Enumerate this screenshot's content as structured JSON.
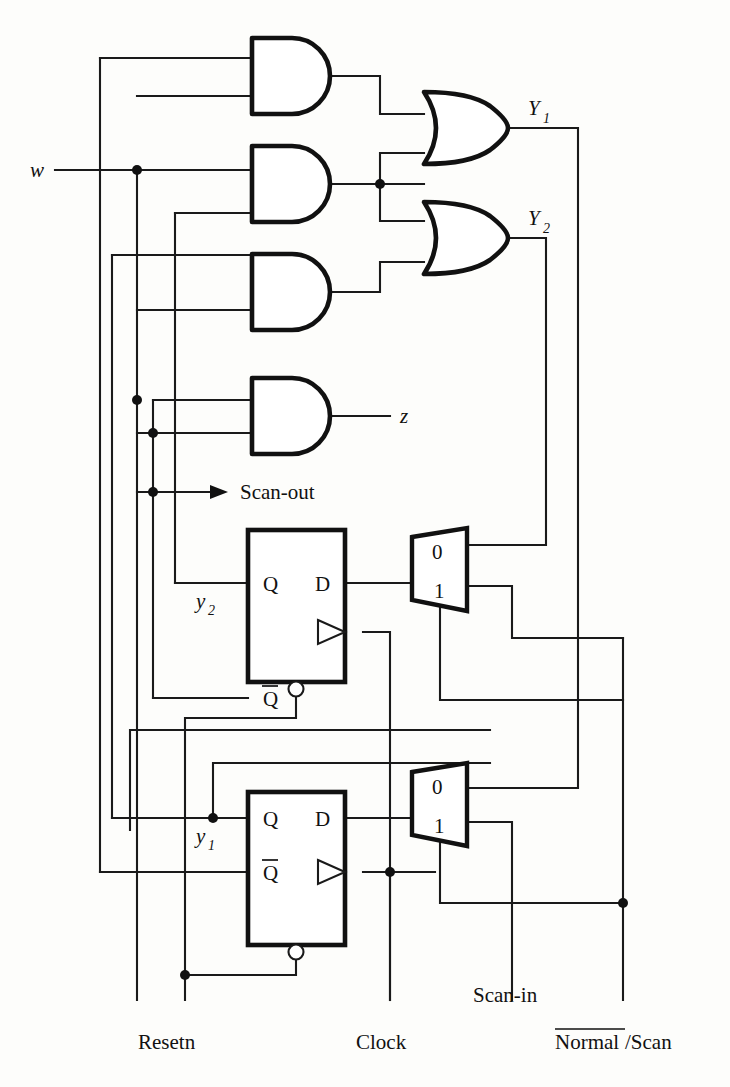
{
  "figure": {
    "type": "logic-circuit-schematic"
  },
  "inputs": {
    "w": "w",
    "resetn": "Resetn",
    "clock": "Clock",
    "scan_in": "Scan-in",
    "normal_scan_overline": "Normal",
    "normal_scan_rest": "/Scan"
  },
  "outputs": {
    "Y1": "Y",
    "Y1_sub": "1",
    "Y2": "Y",
    "Y2_sub": "2",
    "z": "z",
    "scan_out": "Scan-out"
  },
  "state_labels": {
    "y2": "y",
    "y2_sub": "2",
    "y1": "y",
    "y1_sub": "1"
  },
  "flipflops": [
    {
      "name": "ff-y2",
      "pin_q": "Q",
      "pin_d": "D",
      "pin_qbar": "Q",
      "state_label": "y",
      "state_sub": "2"
    },
    {
      "name": "ff-y1",
      "pin_q": "Q",
      "pin_d": "D",
      "pin_qbar": "Q",
      "state_label": "y",
      "state_sub": "1"
    }
  ],
  "multiplexers": [
    {
      "name": "mux-y2",
      "input_0": "0",
      "input_1": "1"
    },
    {
      "name": "mux-y1",
      "input_0": "0",
      "input_1": "1"
    }
  ],
  "gates": {
    "and_gates": 4,
    "or_gates": 2
  },
  "colors": {
    "ink": "#111111",
    "wire": "#1a1a1a",
    "paper": "#fdfdfb"
  }
}
